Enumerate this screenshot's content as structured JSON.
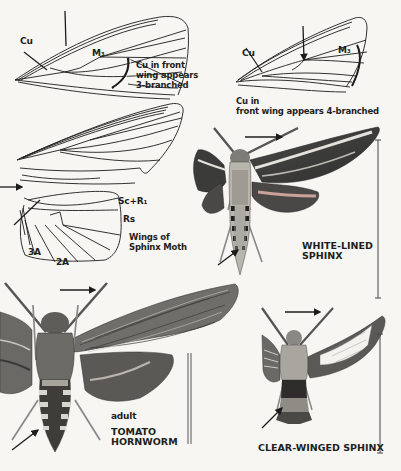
{
  "figures": {
    "wing_left": {
      "vein_labels": [
        "Cu",
        "M₃"
      ],
      "caption": [
        "Cu in front",
        "wing appears",
        "3-branched"
      ]
    },
    "wing_right": {
      "vein_labels": [
        "Cu",
        "M₃"
      ],
      "caption": [
        "Cu in",
        "front wing appears 4-branched"
      ]
    },
    "sphinx_wings": {
      "vein_labels": [
        "Sc+R₁",
        "Rs",
        "3A",
        "2A"
      ],
      "caption": [
        "Wings of",
        "Sphinx Moth"
      ]
    },
    "white_lined_sphinx": {
      "name": [
        "WHITE-LINED",
        "SPHINX"
      ]
    },
    "tomato_hornworm": {
      "stage": "adult",
      "name": [
        "TOMATO",
        "HORNWORM"
      ]
    },
    "clear_winged_sphinx": {
      "name": "CLEAR-WINGED SPHINX"
    }
  },
  "colors": {
    "ink": "#1c1c1c",
    "paper": "#f7f6f2",
    "moth_dark": "#3a3a3a",
    "moth_mid": "#8a8a86",
    "moth_light": "#d6d4ce"
  }
}
